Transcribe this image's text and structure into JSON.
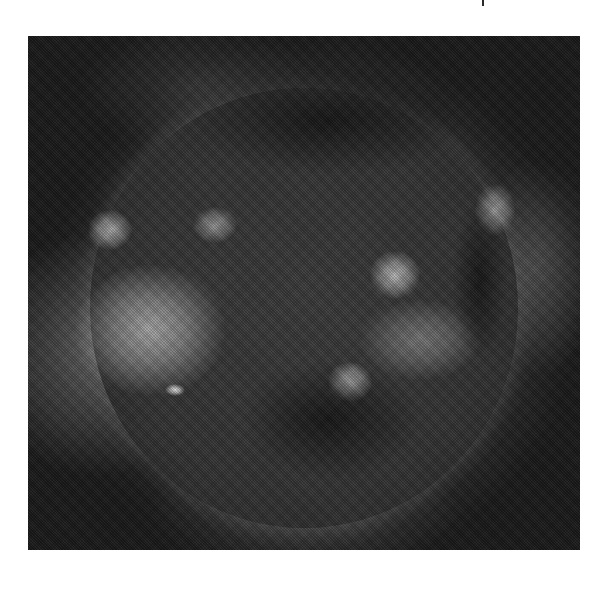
{
  "image": {
    "subject": "solar-xray-disk",
    "grayscale": true,
    "frame": {
      "x": 28,
      "y": 36,
      "width": 552,
      "height": 514
    },
    "features": [
      {
        "name": "active-region-southwest-large",
        "cx": 150,
        "cy": 330,
        "rx": 75,
        "ry": 65,
        "brightness": "#a8a8a8"
      },
      {
        "name": "active-region-bright-kernel",
        "cx": 175,
        "cy": 390,
        "rx": 10,
        "ry": 6,
        "brightness": "#e8e8e8"
      },
      {
        "name": "active-region-west-limb",
        "cx": 110,
        "cy": 230,
        "rx": 22,
        "ry": 20,
        "brightness": "#b0b0b0"
      },
      {
        "name": "active-region-center",
        "cx": 215,
        "cy": 225,
        "rx": 22,
        "ry": 18,
        "brightness": "#9a9a9a"
      },
      {
        "name": "active-region-east-center",
        "cx": 395,
        "cy": 275,
        "rx": 25,
        "ry": 24,
        "brightness": "#b8b8b8"
      },
      {
        "name": "active-region-south-bright",
        "cx": 350,
        "cy": 382,
        "rx": 22,
        "ry": 20,
        "brightness": "#cfcfcf"
      },
      {
        "name": "loop-arc-southeast",
        "cx": 420,
        "cy": 340,
        "rx": 60,
        "ry": 40,
        "brightness": "#7a7a7a"
      },
      {
        "name": "active-region-northeast-limb",
        "cx": 495,
        "cy": 210,
        "rx": 20,
        "ry": 26,
        "brightness": "#9c9c9c"
      },
      {
        "name": "coronal-hole-north",
        "cx": 330,
        "cy": 120,
        "rx": 140,
        "ry": 55
      },
      {
        "name": "coronal-hole-south-center",
        "cx": 330,
        "cy": 420,
        "rx": 90,
        "ry": 60
      },
      {
        "name": "coronal-hole-east",
        "cx": 480,
        "cy": 280,
        "rx": 28,
        "ry": 80
      }
    ]
  },
  "page": {
    "tick_mark": {
      "x": 482,
      "y": 0
    }
  }
}
